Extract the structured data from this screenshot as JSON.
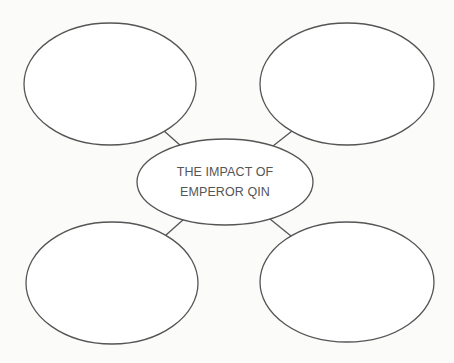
{
  "diagram": {
    "type": "bubble-map",
    "center": {
      "lines": [
        "THE IMPACT OF",
        "EMPEROR QIN"
      ]
    },
    "outer_bubbles": [
      {
        "position": "top-left",
        "text": ""
      },
      {
        "position": "top-right",
        "text": ""
      },
      {
        "position": "bottom-left",
        "text": ""
      },
      {
        "position": "bottom-right",
        "text": ""
      }
    ],
    "colors": {
      "stroke": "#555555",
      "text": "#555555",
      "background": "#fbfbfa"
    }
  }
}
